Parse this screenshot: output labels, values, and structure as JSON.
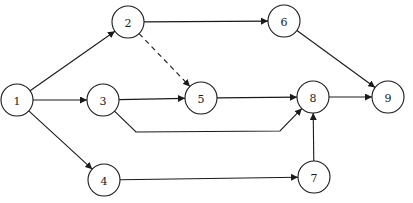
{
  "diagram": {
    "type": "activity-network",
    "nodes": [
      {
        "id": "1",
        "label": "1",
        "x": 17,
        "y": 100
      },
      {
        "id": "2",
        "label": "2",
        "x": 128,
        "y": 22
      },
      {
        "id": "3",
        "label": "3",
        "x": 103,
        "y": 100
      },
      {
        "id": "4",
        "label": "4",
        "x": 104,
        "y": 180
      },
      {
        "id": "5",
        "label": "5",
        "x": 201,
        "y": 98
      },
      {
        "id": "6",
        "label": "6",
        "x": 284,
        "y": 21
      },
      {
        "id": "7",
        "label": "7",
        "x": 314,
        "y": 177
      },
      {
        "id": "8",
        "label": "8",
        "x": 313,
        "y": 97
      },
      {
        "id": "9",
        "label": "9",
        "x": 388,
        "y": 97
      }
    ],
    "edges": [
      {
        "from": "1",
        "to": "2",
        "style": "solid"
      },
      {
        "from": "1",
        "to": "3",
        "style": "solid"
      },
      {
        "from": "1",
        "to": "4",
        "style": "solid"
      },
      {
        "from": "2",
        "to": "6",
        "style": "solid"
      },
      {
        "from": "2",
        "to": "5",
        "style": "dashed"
      },
      {
        "from": "3",
        "to": "5",
        "style": "solid"
      },
      {
        "from": "3",
        "to": "8",
        "style": "solid",
        "waypoints": [
          [
            136,
            132
          ],
          [
            280,
            131
          ]
        ]
      },
      {
        "from": "5",
        "to": "8",
        "style": "solid"
      },
      {
        "from": "6",
        "to": "9",
        "style": "solid"
      },
      {
        "from": "8",
        "to": "9",
        "style": "solid"
      },
      {
        "from": "4",
        "to": "7",
        "style": "solid"
      },
      {
        "from": "7",
        "to": "8",
        "style": "solid"
      }
    ],
    "node_radius": 16,
    "colors": {
      "stroke": "#1a1a1a",
      "fill": "#ffffff"
    }
  }
}
